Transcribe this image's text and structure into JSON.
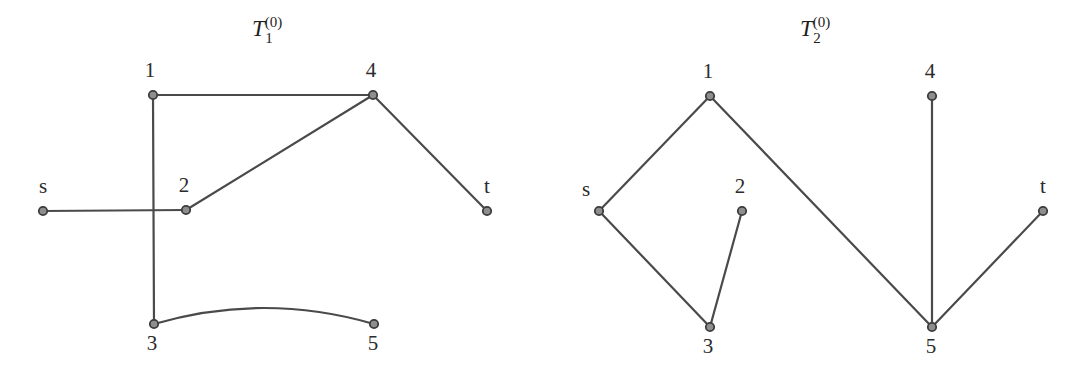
{
  "figure": {
    "background_color": "#ffffff",
    "edge_color": "#4a4a4a",
    "node_fill_color": "#8e8e8e",
    "node_stroke_color": "#3c3c3c",
    "label_color": "#2b2b2b",
    "width": 1080,
    "height": 375
  },
  "graphs": [
    {
      "id": "left-graph",
      "title": {
        "base": "T",
        "sub": "1",
        "sup": "(0)",
        "full": "T_1^(0)"
      },
      "nodes": [
        {
          "id": "s",
          "label": "s",
          "x": 43,
          "y": 211,
          "label_x": 43,
          "label_y": 193
        },
        {
          "id": "1",
          "label": "1",
          "x": 153,
          "y": 95,
          "label_x": 150,
          "label_y": 77
        },
        {
          "id": "2",
          "label": "2",
          "x": 186,
          "y": 210,
          "label_x": 184,
          "label_y": 192
        },
        {
          "id": "3",
          "label": "3",
          "x": 154,
          "y": 324,
          "label_x": 152,
          "label_y": 350
        },
        {
          "id": "4",
          "label": "4",
          "x": 373,
          "y": 95,
          "label_x": 371,
          "label_y": 77
        },
        {
          "id": "5",
          "label": "5",
          "x": 374,
          "y": 324,
          "label_x": 373,
          "label_y": 350
        },
        {
          "id": "t",
          "label": "t",
          "x": 487,
          "y": 211,
          "label_x": 487,
          "label_y": 193
        }
      ],
      "edges": [
        {
          "from": "s",
          "to": "2",
          "kind": "line"
        },
        {
          "from": "1",
          "to": "4",
          "kind": "line"
        },
        {
          "from": "1",
          "to": "3",
          "kind": "line"
        },
        {
          "from": "2",
          "to": "4",
          "kind": "line"
        },
        {
          "from": "4",
          "to": "t",
          "kind": "line"
        },
        {
          "from": "3",
          "to": "5",
          "kind": "curve",
          "bow": 16
        }
      ]
    },
    {
      "id": "right-graph",
      "title": {
        "base": "T",
        "sub": "2",
        "sup": "(0)",
        "full": "T_2^(0)"
      },
      "nodes": [
        {
          "id": "s",
          "label": "s",
          "x": 599,
          "y": 211,
          "label_x": 586,
          "label_y": 196
        },
        {
          "id": "1",
          "label": "1",
          "x": 710,
          "y": 96,
          "label_x": 708,
          "label_y": 78
        },
        {
          "id": "2",
          "label": "2",
          "x": 742,
          "y": 211,
          "label_x": 740,
          "label_y": 193
        },
        {
          "id": "3",
          "label": "3",
          "x": 710,
          "y": 327,
          "label_x": 708,
          "label_y": 353
        },
        {
          "id": "4",
          "label": "4",
          "x": 932,
          "y": 96,
          "label_x": 930,
          "label_y": 78
        },
        {
          "id": "5",
          "label": "5",
          "x": 932,
          "y": 327,
          "label_x": 931,
          "label_y": 353
        },
        {
          "id": "t",
          "label": "t",
          "x": 1043,
          "y": 211,
          "label_x": 1043,
          "label_y": 193
        }
      ],
      "edges": [
        {
          "from": "s",
          "to": "1",
          "kind": "line"
        },
        {
          "from": "s",
          "to": "3",
          "kind": "line"
        },
        {
          "from": "3",
          "to": "2",
          "kind": "line"
        },
        {
          "from": "1",
          "to": "5",
          "kind": "line"
        },
        {
          "from": "4",
          "to": "5",
          "kind": "line"
        },
        {
          "from": "5",
          "to": "t",
          "kind": "line"
        }
      ]
    }
  ]
}
